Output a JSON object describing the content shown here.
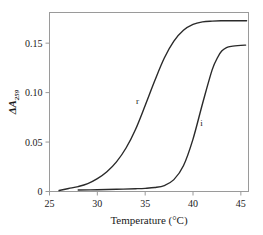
{
  "chart_data": {
    "type": "line",
    "title": "",
    "xlabel": "Temperature (°C)",
    "ylabel": "ΔA",
    "ylabel_subscript": "259",
    "xlim": [
      25,
      45.8
    ],
    "ylim": [
      0,
      0.181
    ],
    "xticks": [
      25,
      30,
      35,
      40,
      45
    ],
    "xtick_labels": [
      "25",
      "30",
      "35",
      "40",
      "45"
    ],
    "yticks": [
      0,
      0.05,
      0.1,
      0.15
    ],
    "ytick_labels": [
      "0",
      "0.05",
      "0.10",
      "0.15"
    ],
    "grid": false,
    "legend_position": "inline-annotations",
    "series": [
      {
        "name": "r",
        "label": "r",
        "label_x": 34.2,
        "label_y": 0.088,
        "plateau": 0.172,
        "midpoint": 36.2,
        "x": [
          26.0,
          27.0,
          28.0,
          29.0,
          30.0,
          31.0,
          32.0,
          33.0,
          34.0,
          35.0,
          36.0,
          37.0,
          38.0,
          39.0,
          40.0,
          41.0,
          42.0,
          43.0,
          44.0,
          45.0,
          45.6
        ],
        "y": [
          0.001,
          0.003,
          0.005,
          0.008,
          0.013,
          0.02,
          0.03,
          0.044,
          0.063,
          0.087,
          0.112,
          0.135,
          0.152,
          0.163,
          0.169,
          0.1715,
          0.1723,
          0.1726,
          0.1727,
          0.1727,
          0.1727
        ]
      },
      {
        "name": "i",
        "label": "i",
        "label_x": 40.9,
        "label_y": 0.066,
        "plateau": 0.148,
        "midpoint": 41.6,
        "x": [
          28.0,
          30.0,
          32.0,
          34.0,
          35.0,
          36.0,
          37.0,
          38.0,
          39.0,
          40.0,
          41.0,
          42.0,
          42.6,
          43.0,
          43.5,
          44.0,
          45.0,
          45.5
        ],
        "y": [
          0.0015,
          0.0018,
          0.0022,
          0.0028,
          0.0032,
          0.004,
          0.006,
          0.012,
          0.026,
          0.053,
          0.089,
          0.123,
          0.136,
          0.142,
          0.1455,
          0.1468,
          0.1478,
          0.148
        ]
      }
    ]
  }
}
